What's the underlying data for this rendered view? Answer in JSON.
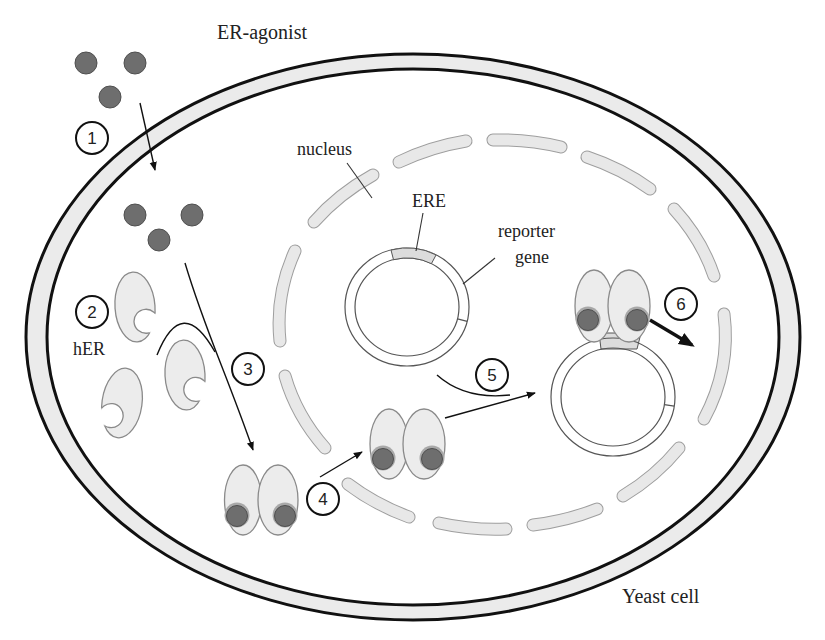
{
  "figure": {
    "labels": {
      "agonist": "ER-agonist",
      "nucleus": "nucleus",
      "ere": "ERE",
      "reporter_gene": [
        "reporter",
        "gene"
      ],
      "her": "hER",
      "cell": "Yeast cell"
    },
    "steps": [
      "1",
      "2",
      "3",
      "4",
      "5",
      "6"
    ],
    "legend_icons": {
      "agonist": "filled-grey-circle",
      "receptor": "oval-with-crescent-notch",
      "receptor_dimer": "paired-ovals-with-bound-ligand",
      "plasmid": "double-ring-circle",
      "nuclear_envelope": "dashed-capsule-ring",
      "cell_wall": "double-black-ellipse"
    }
  },
  "colors": {
    "wall-line": "#111111",
    "wall-fill": "#ebebeb",
    "nucleus-outline": "#9e9e9e",
    "nucleus-fill": "#e8e8e8",
    "agonist-fill": "#6e6e6e",
    "agonist-outline": "#4f4f4f",
    "receptor-fill": "#ececec",
    "receptor-outline": "#8a8a8a",
    "ere-fill": "#dcdcdc",
    "plasmid-line": "#555555",
    "arrow": "#111111",
    "text": "#222222"
  }
}
